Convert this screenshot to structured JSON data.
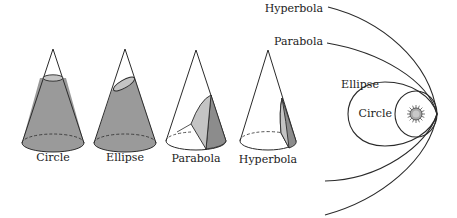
{
  "cones": [
    {
      "id": "circle",
      "label": "Circle"
    },
    {
      "id": "ellipse",
      "label": "Ellipse"
    },
    {
      "id": "parabola",
      "label": "Parabola"
    },
    {
      "id": "hyperbola",
      "label": "Hyperbola"
    }
  ],
  "orbits": [
    {
      "id": "hyperbola",
      "label": "Hyperbola"
    },
    {
      "id": "parabola",
      "label": "Parabola"
    },
    {
      "id": "ellipse",
      "label": "Ellipse"
    },
    {
      "id": "circle",
      "label": "Circle"
    }
  ],
  "colors": {
    "cone_fill": "#9a9a9a",
    "section_fill": "#c4c4c4",
    "section_fill_dark": "#8c8c8c",
    "stroke": "#2a2a2a"
  },
  "icons": {
    "sun": "sun-icon"
  }
}
